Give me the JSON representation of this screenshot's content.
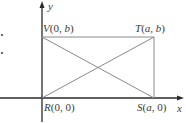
{
  "diagram": {
    "type": "coordinate-rectangle",
    "axes": {
      "x_label": "x",
      "y_label": "y"
    },
    "points": {
      "V": {
        "name": "V",
        "coords": "(0, b)",
        "x": "0",
        "y": "b"
      },
      "T": {
        "name": "T",
        "coords": "(a, b)",
        "x": "a",
        "y": "b"
      },
      "R": {
        "name": "R",
        "coords": "(0, 0)",
        "x": "0",
        "y": "0"
      },
      "S": {
        "name": "S",
        "coords": "(a, 0)",
        "x": "a",
        "y": "0"
      }
    },
    "segments": [
      {
        "from": "R",
        "to": "S",
        "kind": "side"
      },
      {
        "from": "S",
        "to": "T",
        "kind": "side"
      },
      {
        "from": "T",
        "to": "V",
        "kind": "side"
      },
      {
        "from": "V",
        "to": "R",
        "kind": "side"
      },
      {
        "from": "R",
        "to": "T",
        "kind": "diagonal"
      },
      {
        "from": "V",
        "to": "S",
        "kind": "diagonal"
      }
    ],
    "colors": {
      "axis": "#2a2a2a",
      "rect": "#8a8a8a",
      "text": "#3a3a3a"
    }
  }
}
